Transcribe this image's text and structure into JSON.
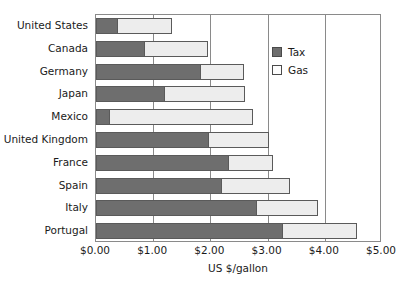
{
  "chart_data": {
    "type": "bar",
    "orientation": "horizontal",
    "stacked": true,
    "title": "",
    "xlabel": "US $/gallon",
    "ylabel": "",
    "xlim": [
      0,
      5
    ],
    "xticks": [
      0,
      1,
      2,
      3,
      4,
      5
    ],
    "xticklabels": [
      "$0.00",
      "$1.00",
      "$2.00",
      "$3.00",
      "$4.00",
      "$5.00"
    ],
    "grid": "vertical",
    "legend_position": "upper-right-inside",
    "categories": [
      "United States",
      "Canada",
      "Germany",
      "Japan",
      "Mexico",
      "United Kingdom",
      "France",
      "Spain",
      "Italy",
      "Portugal"
    ],
    "series": [
      {
        "name": "Tax",
        "color": "#6e6e6e",
        "values": [
          0.37,
          0.84,
          1.81,
          1.19,
          0.23,
          1.96,
          2.3,
          2.18,
          2.79,
          3.26
        ]
      },
      {
        "name": "Gas",
        "color": "#ededed",
        "values": [
          0.96,
          1.11,
          0.77,
          1.41,
          2.52,
          1.06,
          0.8,
          1.21,
          1.09,
          1.3
        ]
      }
    ],
    "totals": [
      1.33,
      1.95,
      2.58,
      2.6,
      2.75,
      3.02,
      3.1,
      3.39,
      3.88,
      4.56
    ]
  },
  "legend": {
    "items": [
      {
        "label": "Tax",
        "swatch": "tax-swatch-icon"
      },
      {
        "label": "Gas",
        "swatch": "gas-swatch-icon"
      }
    ]
  }
}
